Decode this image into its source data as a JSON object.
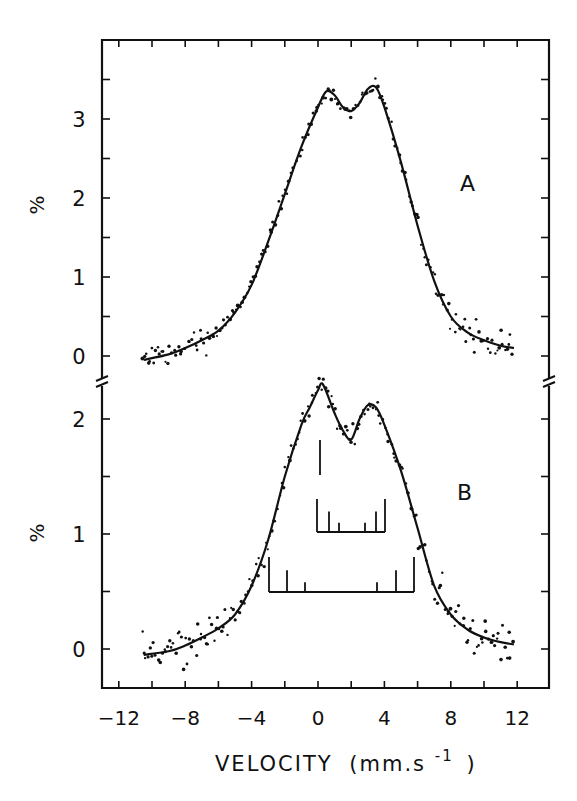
{
  "chart_data": {
    "type": "scatter",
    "xlabel": "VELOCITY (mm.s⁻¹)",
    "xlabel_main": "VELOCITY",
    "xlabel_unit": "(mm.s",
    "xlabel_sup": "-1",
    "xlabel_close": ")",
    "xlim": [
      -13.5,
      14.2
    ],
    "xticks": [
      -12,
      -8,
      -4,
      0,
      4,
      8,
      12
    ],
    "xticks_labels": [
      "−12",
      "−8",
      "−4",
      "0",
      "4",
      "8",
      "12"
    ],
    "minor_xtick_step": 2,
    "grid": false,
    "legend": null,
    "axis_break": "between panels on both vertical axes",
    "panels": [
      {
        "label": "A",
        "ylabel": "%",
        "ylim": [
          -0.35,
          3.9
        ],
        "yticks": [
          0,
          1,
          2,
          3
        ],
        "yticks_labels": [
          "0",
          "1",
          "2",
          "3"
        ],
        "fit_curve": {
          "x": [
            -10.5,
            -9,
            -8,
            -7,
            -6,
            -5,
            -4,
            -3,
            -2,
            -1,
            0,
            0.5,
            1,
            1.5,
            2,
            2.5,
            3,
            3.5,
            4,
            5,
            6,
            7,
            8,
            9,
            10,
            11,
            11.8
          ],
          "y": [
            -0.05,
            0.02,
            0.1,
            0.2,
            0.32,
            0.55,
            0.9,
            1.45,
            2.05,
            2.65,
            3.15,
            3.35,
            3.3,
            3.15,
            3.1,
            3.2,
            3.38,
            3.4,
            3.15,
            2.45,
            1.65,
            0.95,
            0.5,
            0.3,
            0.2,
            0.13,
            0.1
          ]
        },
        "approx_points_description": "~200 scattered data points following fit, noise ~±0.15%",
        "peaks": [
          {
            "v": 0.6,
            "y": 3.38
          },
          {
            "v": 3.3,
            "y": 3.42
          }
        ],
        "valley": {
          "v": 2.0,
          "y": 3.08
        }
      },
      {
        "label": "B",
        "ylabel": "%",
        "ylim": [
          -0.35,
          2.3
        ],
        "yticks": [
          0,
          1,
          2
        ],
        "yticks_labels": [
          "0",
          "1",
          "2"
        ],
        "fit_curve": {
          "x": [
            -10.5,
            -9,
            -8,
            -7,
            -6,
            -5,
            -4,
            -3,
            -2,
            -1,
            -0.5,
            0,
            0.3,
            1,
            1.5,
            2,
            2.5,
            3,
            3.5,
            4,
            5,
            6,
            7,
            8,
            9,
            10,
            11,
            11.8
          ],
          "y": [
            -0.05,
            -0.02,
            0.03,
            0.1,
            0.18,
            0.3,
            0.55,
            0.95,
            1.5,
            1.95,
            2.1,
            2.25,
            2.3,
            2.05,
            1.9,
            1.82,
            2.0,
            2.12,
            2.1,
            1.95,
            1.55,
            1.05,
            0.55,
            0.3,
            0.17,
            0.1,
            0.06,
            0.04
          ]
        },
        "approx_points_description": "~200 scattered data points following fit, noise ~±0.15%",
        "peaks": [
          {
            "v": 0.2,
            "y": 2.28
          },
          {
            "v": 3.0,
            "y": 2.12
          }
        ],
        "valley": {
          "v": 1.9,
          "y": 1.82
        },
        "stick_diagrams": [
          {
            "name": "singlet",
            "lines": [
              {
                "v": 0.1,
                "height_pct": 0.3
              }
            ],
            "baseline_pct": 1.5
          },
          {
            "name": "sextet-inner",
            "range_v": [
              -0.1,
              4.1
            ],
            "lines_v": [
              -0.1,
              0.6,
              1.3,
              2.9,
              3.5,
              4.1
            ],
            "line_rel_heights": [
              3,
              2,
              1,
              1,
              2,
              3
            ],
            "baseline_pct": 1.0
          },
          {
            "name": "sextet-outer",
            "range_v": [
              -3.0,
              5.9
            ],
            "lines_v": [
              -3.0,
              -1.9,
              -0.8,
              3.6,
              4.7,
              5.9
            ],
            "line_rel_heights": [
              3,
              2,
              1,
              1,
              2,
              3
            ],
            "baseline_pct": 0.5
          }
        ]
      }
    ]
  },
  "figure": {
    "panel_label_a": "A",
    "panel_label_b": "B",
    "ylabel_a": "%",
    "ylabel_b": "%",
    "top_cut_text": "...2 g)..."
  }
}
